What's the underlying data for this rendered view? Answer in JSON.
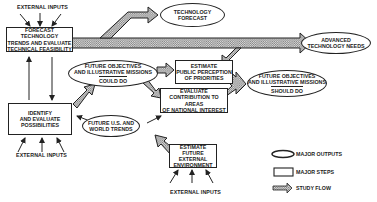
{
  "diagram": {
    "external_inputs_label": "EXTERNAL INPUTS",
    "nodes": {
      "forecast": {
        "type": "step",
        "lines": [
          "FORECAST TECHNOLOGY",
          "TRENDS AND EVALUATE",
          "TECHNICAL FEASIBILITY"
        ]
      },
      "identify": {
        "type": "step",
        "lines": [
          "IDENTIFY",
          "AND EVALUATE",
          "POSSIBILITIES"
        ]
      },
      "tech_forecast": {
        "type": "output",
        "lines": [
          "TECHNOLOGY",
          "FORECAST"
        ]
      },
      "adv_needs": {
        "type": "output",
        "lines": [
          "ADVANCED",
          "TECHNOLOGY NEEDS"
        ]
      },
      "could_do": {
        "type": "output",
        "lines": [
          "FUTURE OBJECTIVES",
          "AND ILLUSTRATIVE MISSIONS"
        ],
        "sub": "COULD DO"
      },
      "public": {
        "type": "step",
        "lines": [
          "ESTIMATE",
          "PUBLIC PERCEPTION",
          "OF PRIORITIES"
        ]
      },
      "national": {
        "type": "step",
        "lines": [
          "EVALUATE",
          "CONTRIBUTION TO AREAS",
          "OF NATIONAL INTEREST"
        ]
      },
      "should_do": {
        "type": "output",
        "lines": [
          "FUTURE OBJECTIVES",
          "AND ILLUSTRATIVE MISSIONS"
        ],
        "sub": "SHOULD DO"
      },
      "world": {
        "type": "output",
        "lines": [
          "FUTURE U.S. AND",
          "WORLD TRENDS"
        ]
      },
      "external_env": {
        "type": "step",
        "lines": [
          "ESTIMATE",
          "FUTURE EXTERNAL",
          "ENVIRONMENT"
        ]
      }
    },
    "legend": {
      "outputs": "MAJOR OUTPUTS",
      "steps": "MAJOR STEPS",
      "flow": "STUDY FLOW"
    }
  }
}
